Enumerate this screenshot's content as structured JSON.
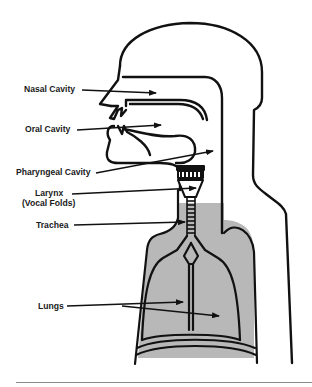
{
  "diagram": {
    "colors": {
      "outline": "#111111",
      "lung_fill": "#b8b8b8",
      "background": "#ffffff",
      "divider": "#8a8a8a"
    },
    "labels": [
      {
        "id": "nasal-cavity",
        "text": "Nasal Cavity"
      },
      {
        "id": "oral-cavity",
        "text": "Oral Cavity"
      },
      {
        "id": "pharyngeal-cavity",
        "text": "Pharyngeal Cavity"
      },
      {
        "id": "larynx",
        "text": "Larynx",
        "subtext": "(Vocal Folds)"
      },
      {
        "id": "trachea",
        "text": "Trachea"
      },
      {
        "id": "lungs",
        "text": "Lungs"
      }
    ]
  }
}
